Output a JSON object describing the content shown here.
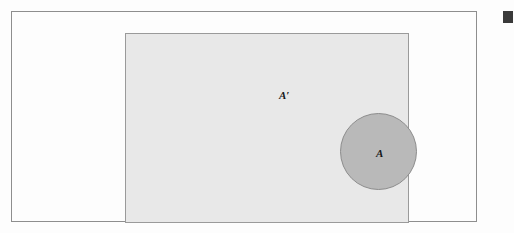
{
  "figure": {
    "outer_frame": {
      "name": "figure-border"
    },
    "universal_set": {
      "label": "A′",
      "description": "Universal set rectangle shaded light gray representing the complement of A",
      "fill_color": "#e8e8e8",
      "border_color": "#9a9a9a"
    },
    "set_a": {
      "label": "A",
      "description": "Shaded circle representing set A",
      "fill_color": "#b9b9b9",
      "border_color": "#8c8c8c"
    },
    "ghost_text": {
      "heading": "of Addition",
      "subline": "mutually exclusive events"
    },
    "margin_marker": {
      "name": "page-margin-block",
      "color": "#3a3a3a"
    }
  },
  "chart_data": {
    "type": "diagram",
    "regions": [
      {
        "label": "A′",
        "shape": "rectangle",
        "role": "complement-of-A",
        "fill": "#e8e8e8",
        "x": 113,
        "y": 21,
        "width": 284,
        "height": 190
      },
      {
        "label": "A",
        "shape": "circle",
        "role": "set-A",
        "fill": "#b9b9b9",
        "cx": 252.5,
        "cy": 117.5,
        "r": 38.5
      }
    ],
    "annotations": [
      {
        "text": "A′",
        "x": 158,
        "y": 64
      },
      {
        "text": "A",
        "x": 250,
        "y": 118
      }
    ],
    "legend": "none",
    "grid": false
  }
}
